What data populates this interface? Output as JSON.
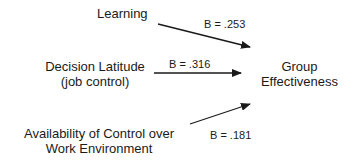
{
  "diagram": {
    "nodes": [
      {
        "id": "learning",
        "lines": [
          "Learning"
        ]
      },
      {
        "id": "decision_latitude",
        "lines": [
          "Decision Latitude",
          "(job control)"
        ]
      },
      {
        "id": "availability_control",
        "lines": [
          "Availability of Control over",
          "Work Environment"
        ]
      },
      {
        "id": "group_effectiveness",
        "lines": [
          "Group",
          "Effectiveness"
        ]
      }
    ],
    "edges": [
      {
        "from": "learning",
        "to": "group_effectiveness",
        "label": "B = .253"
      },
      {
        "from": "decision_latitude",
        "to": "group_effectiveness",
        "label": "B = .316"
      },
      {
        "from": "availability_control",
        "to": "group_effectiveness",
        "label": "B = .181"
      }
    ],
    "colors": {
      "text": "#1a1a1a",
      "arrow": "#1a1a1a",
      "background": "#ffffff"
    }
  }
}
